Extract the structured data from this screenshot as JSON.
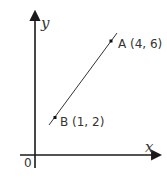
{
  "diagram": {
    "type": "coordinate-plane",
    "axes": {
      "x_label": "x",
      "y_label": "y",
      "origin_label": "0",
      "color": "#1a1a1a"
    },
    "segment": {
      "color": "#333333",
      "points": [
        {
          "name": "A",
          "label": "A (4, 6)",
          "x": 4,
          "y": 6
        },
        {
          "name": "B",
          "label": "B (1, 2)",
          "x": 1,
          "y": 2
        }
      ]
    }
  }
}
